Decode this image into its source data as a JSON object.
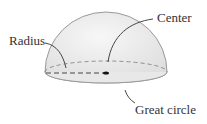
{
  "diagram": {
    "labels": {
      "center": "Center",
      "radius": "Radius",
      "great_circle": "Great circle"
    },
    "colors": {
      "fill": "#ececec",
      "stroke": "#9a9a9a",
      "text": "#333333",
      "dash": "#555555"
    }
  }
}
